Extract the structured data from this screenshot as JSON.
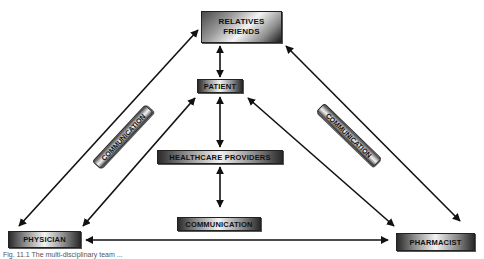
{
  "diagram": {
    "nodes": {
      "relatives_line1": "RELATIVES",
      "relatives_line2": "FRIENDS",
      "patient": "PATIENT",
      "healthcare_providers": "HEALTHCARE PROVIDERS",
      "physician": "PHYSICIAN",
      "pharmacist": "PHARMACIST"
    },
    "labels": {
      "communication_left": "COMMUNICATION",
      "communication_right": "COMMUNICATION",
      "communication_center": "COMMUNICATION"
    },
    "edges": [
      {
        "from": "RELATIVES FRIENDS",
        "to": "PATIENT",
        "type": "bidirectional"
      },
      {
        "from": "PATIENT",
        "to": "HEALTHCARE PROVIDERS",
        "type": "bidirectional"
      },
      {
        "from": "HEALTHCARE PROVIDERS",
        "to": "COMMUNICATION",
        "type": "bidirectional"
      },
      {
        "from": "RELATIVES FRIENDS",
        "to": "PHYSICIAN",
        "type": "bidirectional"
      },
      {
        "from": "RELATIVES FRIENDS",
        "to": "PHARMACIST",
        "type": "bidirectional"
      },
      {
        "from": "PATIENT",
        "to": "PHYSICIAN",
        "type": "bidirectional"
      },
      {
        "from": "PATIENT",
        "to": "PHARMACIST",
        "type": "bidirectional"
      },
      {
        "from": "PHYSICIAN",
        "to": "PHARMACIST",
        "type": "bidirectional"
      }
    ],
    "colors": {
      "line": "#111111",
      "box_dark": "#2a2a2a",
      "box_light": "#f2f2f2"
    }
  },
  "caption": "Fig. 11.1 The multi-disciplinary team ..."
}
